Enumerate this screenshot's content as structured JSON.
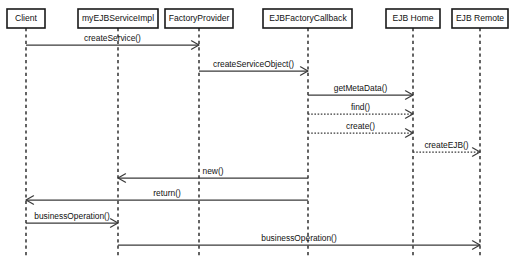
{
  "diagram": {
    "type": "uml-sequence-diagram",
    "width": 510,
    "height": 259,
    "background_color": "#ffffff",
    "line_color": "#3a3a3a",
    "text_color": "#111111"
  },
  "participants": [
    {
      "id": "client",
      "label": "Client",
      "x": 26,
      "box_x": 7,
      "box_y": 9,
      "box_w": 38,
      "box_h": 19
    },
    {
      "id": "service",
      "label": "myEJBServiceImpl",
      "x": 118,
      "box_x": 78,
      "box_y": 9,
      "box_w": 80,
      "box_h": 19
    },
    {
      "id": "factory",
      "label": "FactoryProvider",
      "x": 199,
      "box_x": 165,
      "box_y": 9,
      "box_w": 68,
      "box_h": 19
    },
    {
      "id": "callback",
      "label": "EJBFactoryCallback",
      "x": 308,
      "box_x": 263,
      "box_y": 9,
      "box_w": 89,
      "box_h": 19
    },
    {
      "id": "ejbhome",
      "label": "EJB Home",
      "x": 413,
      "box_x": 386,
      "box_y": 9,
      "box_w": 54,
      "box_h": 19
    },
    {
      "id": "ejbremote",
      "label": "EJB Remote",
      "x": 480,
      "box_x": 452,
      "box_y": 9,
      "box_w": 56,
      "box_h": 19
    }
  ],
  "lifelines": {
    "top": 28,
    "bottom": 256
  },
  "messages": [
    {
      "id": "m1",
      "label": "createService()",
      "from": "client",
      "to": "factory",
      "from_x": 26,
      "to_x": 199,
      "y": 45,
      "style": "solid",
      "direction": "right"
    },
    {
      "id": "m2",
      "label": "createServiceObject()",
      "from": "factory",
      "to": "callback",
      "from_x": 199,
      "to_x": 308,
      "y": 71,
      "style": "solid",
      "direction": "right"
    },
    {
      "id": "m3",
      "label": "getMetaData()",
      "from": "callback",
      "to": "ejbhome",
      "from_x": 308,
      "to_x": 413,
      "y": 95,
      "style": "solid",
      "direction": "right"
    },
    {
      "id": "m4",
      "label": "find()",
      "from": "callback",
      "to": "ejbhome",
      "from_x": 308,
      "to_x": 413,
      "y": 114,
      "style": "dotted",
      "direction": "right"
    },
    {
      "id": "m5",
      "label": "create()",
      "from": "callback",
      "to": "ejbhome",
      "from_x": 308,
      "to_x": 413,
      "y": 133,
      "style": "dotted",
      "direction": "right"
    },
    {
      "id": "m6",
      "label": "createEJB()",
      "from": "ejbhome",
      "to": "ejbremote",
      "from_x": 413,
      "to_x": 480,
      "y": 152,
      "style": "dotted",
      "direction": "right"
    },
    {
      "id": "m7",
      "label": "new()",
      "from": "callback",
      "to": "service",
      "from_x": 308,
      "to_x": 118,
      "y": 178,
      "style": "solid",
      "direction": "left"
    },
    {
      "id": "m8",
      "label": "return()",
      "from": "callback",
      "to": "client",
      "from_x": 308,
      "to_x": 26,
      "y": 200,
      "style": "solid",
      "direction": "left"
    },
    {
      "id": "m9",
      "label": "businessOperation()",
      "from": "client",
      "to": "service",
      "from_x": 26,
      "to_x": 118,
      "y": 223,
      "style": "solid",
      "direction": "right"
    },
    {
      "id": "m10",
      "label": "businessOperation()",
      "from": "service",
      "to": "ejbremote",
      "from_x": 118,
      "to_x": 480,
      "y": 245,
      "style": "solid",
      "direction": "right"
    }
  ]
}
